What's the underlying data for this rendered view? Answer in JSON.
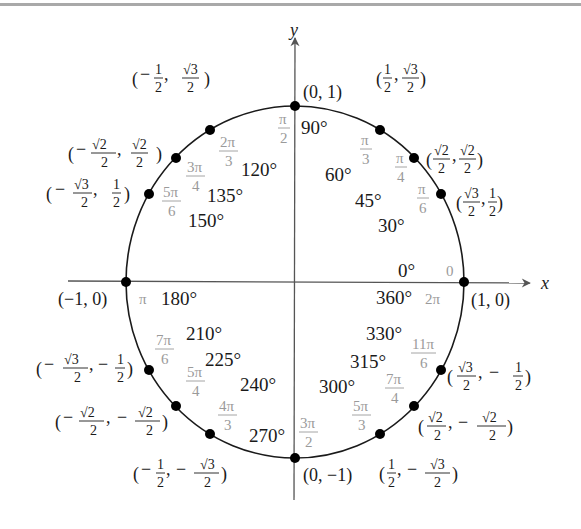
{
  "diagram": {
    "axes": {
      "x_label": "x",
      "y_label": "y"
    },
    "colors": {
      "ink": "#1a1a1a",
      "radian": "#9a9a9a",
      "axis": "#555555",
      "rule": "#a9a9a9"
    },
    "points": [
      {
        "deg": "0°",
        "deg2": "360°",
        "rad": "0",
        "rad2": "2π",
        "coord": "(1, 0)"
      },
      {
        "deg": "30°",
        "rad_num": "π",
        "rad_den": "6",
        "coord": "(√3/2, 1/2)"
      },
      {
        "deg": "45°",
        "rad_num": "π",
        "rad_den": "4",
        "coord": "(√2/2, √2/2)"
      },
      {
        "deg": "60°",
        "rad_num": "π",
        "rad_den": "3",
        "coord": "(1/2, √3/2)"
      },
      {
        "deg": "90°",
        "rad_num": "π",
        "rad_den": "2",
        "coord": "(0, 1)"
      },
      {
        "deg": "120°",
        "rad_num": "2π",
        "rad_den": "3",
        "coord": "(−1/2, √3/2)"
      },
      {
        "deg": "135°",
        "rad_num": "3π",
        "rad_den": "4",
        "coord": "(−√2/2, √2/2)"
      },
      {
        "deg": "150°",
        "rad_num": "5π",
        "rad_den": "6",
        "coord": "(−√3/2, 1/2)"
      },
      {
        "deg": "180°",
        "rad": "π",
        "coord": "(−1, 0)"
      },
      {
        "deg": "210°",
        "rad_num": "7π",
        "rad_den": "6",
        "coord": "(−√3/2, −1/2)"
      },
      {
        "deg": "225°",
        "rad_num": "5π",
        "rad_den": "4",
        "coord": "(−√2/2, −√2/2)"
      },
      {
        "deg": "240°",
        "rad_num": "4π",
        "rad_den": "3",
        "coord": "(−1/2, −√3/2)"
      },
      {
        "deg": "270°",
        "rad_num": "3π",
        "rad_den": "2",
        "coord": "(0, −1)"
      },
      {
        "deg": "300°",
        "rad_num": "5π",
        "rad_den": "3",
        "coord": "(1/2, −√3/2)"
      },
      {
        "deg": "315°",
        "rad_num": "7π",
        "rad_den": "4",
        "coord": "(√2/2, −√2/2)"
      },
      {
        "deg": "330°",
        "rad_num": "11π",
        "rad_den": "6",
        "coord": "(√3/2, −1/2)"
      }
    ],
    "frac": {
      "one": "1",
      "two": "2",
      "r2": "√2",
      "r3": "√3",
      "minus": "−",
      "comma": ",",
      "lp": "(",
      "rp": ")"
    }
  }
}
